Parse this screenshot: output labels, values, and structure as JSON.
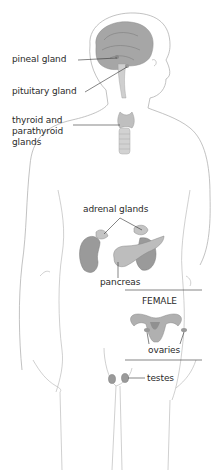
{
  "diagram": {
    "labels": {
      "pineal": "pineal gland",
      "pituitary": "pituitary gland",
      "thyroid_line1": "thyroid and",
      "thyroid_line2": "parathyroid",
      "thyroid_line3": "glands",
      "adrenal": "adrenal glands",
      "pancreas": "pancreas",
      "female": "FEMALE",
      "ovaries": "ovaries",
      "testes": "testes"
    },
    "colors": {
      "outline": "#a8a8a8",
      "organ_fill": "#9a9a9a",
      "organ_light": "#c4c4c4",
      "text": "#2a2a2a",
      "leader": "#333333"
    }
  }
}
